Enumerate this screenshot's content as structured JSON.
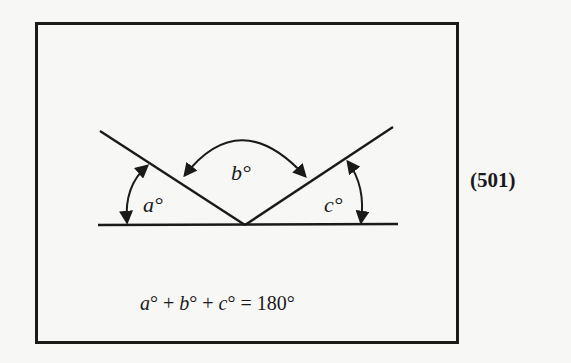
{
  "figure": {
    "equation_number": "(501)",
    "equation": {
      "a": "a",
      "b": "b",
      "c": "c",
      "deg": "°",
      "plus": " + ",
      "equals": " = ",
      "total": "180°"
    },
    "angle_labels": {
      "a": "a°",
      "b": "b°",
      "c": "c°"
    },
    "colors": {
      "ink": "#1a1a1a",
      "paper": "#f7f7f5"
    }
  }
}
